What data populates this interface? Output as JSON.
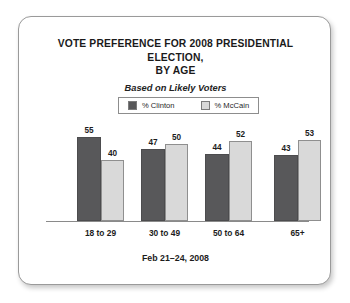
{
  "card": {
    "footer_note": "Feb 21–24, 2008"
  },
  "chart_data": {
    "type": "bar",
    "title": "VOTE PREFERENCE FOR 2008 PRESIDENTIAL ELECTION, BY AGE",
    "title_line1": "VOTE PREFERENCE FOR 2008 PRESIDENTIAL ELECTION,",
    "title_line2": "BY AGE",
    "subtitle": "Based on Likely Voters",
    "xlabel": "",
    "ylabel": "",
    "ylim": [
      0,
      60
    ],
    "grid": false,
    "legend_position": "top-center",
    "categories": [
      "18 to 29",
      "30 to 49",
      "50 to 64",
      "65+"
    ],
    "series": [
      {
        "name": "% Clinton",
        "color": "#58585a",
        "values": [
          55,
          47,
          44,
          43
        ]
      },
      {
        "name": "% McCain",
        "color": "#d9d9d9",
        "values": [
          40,
          50,
          52,
          53
        ]
      }
    ],
    "annotations": [
      "Feb 21–24, 2008"
    ]
  }
}
